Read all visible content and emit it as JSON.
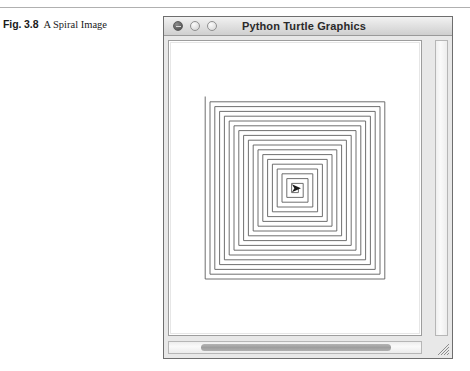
{
  "figure": {
    "label": "Fig. 3.8",
    "text": "A Spiral Image"
  },
  "window": {
    "title": "Python Turtle Graphics",
    "controls": [
      {
        "name": "close-button",
        "icon": "close-icon",
        "color": "#5a5a5a"
      },
      {
        "name": "minimize-button",
        "icon": "minimize-icon",
        "color": "#dcdcdc"
      },
      {
        "name": "maximize-button",
        "icon": "maximize-icon",
        "color": "#e0e0e0"
      }
    ],
    "canvas": {
      "background": "#ffffff",
      "drawing": {
        "type": "square-spiral",
        "line_color": "#5f5f5f",
        "turtle_color": "#1a1a1a",
        "turtle_heading": "east",
        "turns": 76,
        "step_growth": 1.2,
        "center_x": 0,
        "center_y": 0
      }
    },
    "scrollbars": {
      "vertical_name": "vertical-scrollbar",
      "horizontal_name": "horizontal-scrollbar",
      "horizontal_thumb_name": "horizontal-scrollbar-thumb"
    },
    "resize_grip": "resize-grip"
  },
  "colors": {
    "window_border": "#6e6e6e",
    "titlebar_top": "#f2f2f2",
    "titlebar_bottom": "#cfcfcf",
    "frame": "#e8e8e8",
    "rule": "#b0b0b0"
  }
}
